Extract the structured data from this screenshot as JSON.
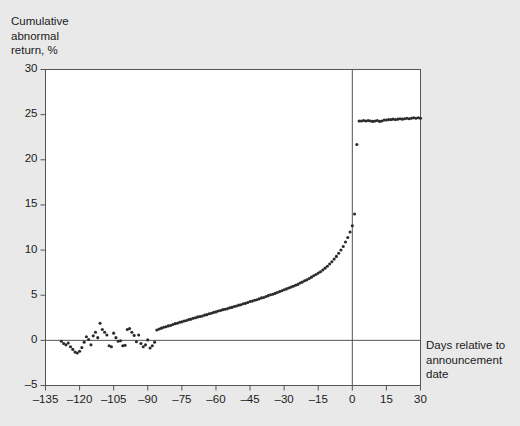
{
  "figure": {
    "background_color": "#e9e9e9",
    "plot_background_color": "#ffffff",
    "axis_color": "#555555",
    "marker_color": "#2b2b2b"
  },
  "chart_data": {
    "type": "scatter",
    "title": "",
    "ylabel": "Cumulative\nabnormal\nreturn, %",
    "xlabel": "Days relative to\nannouncement\ndate",
    "xlim": [
      -135,
      30
    ],
    "ylim": [
      -5,
      30
    ],
    "grid": false,
    "legend": null,
    "xticks": [
      -135,
      -120,
      -105,
      -90,
      -75,
      -60,
      -45,
      -30,
      -15,
      0,
      15,
      30
    ],
    "xtick_labels": [
      "–135",
      "–120",
      "–105",
      "–90",
      "–75",
      "–60",
      "–45",
      "–30",
      "–15",
      "0",
      "15",
      "30"
    ],
    "yticks": [
      -5,
      0,
      5,
      10,
      15,
      20,
      25,
      30
    ],
    "ytick_labels": [
      "–5",
      "0",
      "5",
      "10",
      "15",
      "20",
      "25",
      "30"
    ],
    "reference_lines": [
      {
        "name": "zero-return-line",
        "orientation": "horizontal",
        "value": 0
      },
      {
        "name": "announcement-day-line",
        "orientation": "vertical",
        "value": 0
      }
    ],
    "x": [
      -128,
      -127,
      -126,
      -125,
      -124,
      -123,
      -122,
      -121,
      -120,
      -119,
      -118,
      -117,
      -116,
      -115,
      -114,
      -113,
      -112,
      -111,
      -110,
      -109,
      -108,
      -107,
      -106,
      -105,
      -104,
      -103,
      -102,
      -101,
      -100,
      -99,
      -98,
      -97,
      -96,
      -95,
      -94,
      -93,
      -92,
      -91,
      -90,
      -89,
      -88,
      -87,
      -86,
      -85,
      -84,
      -83,
      -82,
      -81,
      -80,
      -79,
      -78,
      -77,
      -76,
      -75,
      -74,
      -73,
      -72,
      -71,
      -70,
      -69,
      -68,
      -67,
      -66,
      -65,
      -64,
      -63,
      -62,
      -61,
      -60,
      -59,
      -58,
      -57,
      -56,
      -55,
      -54,
      -53,
      -52,
      -51,
      -50,
      -49,
      -48,
      -47,
      -46,
      -45,
      -44,
      -43,
      -42,
      -41,
      -40,
      -39,
      -38,
      -37,
      -36,
      -35,
      -34,
      -33,
      -32,
      -31,
      -30,
      -29,
      -28,
      -27,
      -26,
      -25,
      -24,
      -23,
      -22,
      -21,
      -20,
      -19,
      -18,
      -17,
      -16,
      -15,
      -14,
      -13,
      -12,
      -11,
      -10,
      -9,
      -8,
      -7,
      -6,
      -5,
      -4,
      -3,
      -2,
      -1,
      0,
      1,
      2,
      3,
      4,
      5,
      6,
      7,
      8,
      9,
      10,
      11,
      12,
      13,
      14,
      15,
      16,
      17,
      18,
      19,
      20,
      21,
      22,
      23,
      24,
      25,
      26,
      27,
      28,
      29,
      30
    ],
    "y": [
      -0.1,
      -0.35,
      -0.5,
      -0.3,
      -0.7,
      -1.0,
      -1.3,
      -1.4,
      -1.2,
      -0.8,
      -0.2,
      0.4,
      0.1,
      -0.5,
      0.5,
      0.9,
      0.3,
      1.9,
      1.2,
      0.9,
      0.6,
      -0.6,
      -0.7,
      0.8,
      0.3,
      -0.1,
      -0.05,
      -0.6,
      -0.55,
      1.2,
      1.3,
      0.9,
      0.55,
      -0.15,
      0.6,
      -0.35,
      -0.7,
      -0.5,
      0.05,
      -0.85,
      -0.6,
      -0.2,
      1.15,
      1.25,
      1.35,
      1.45,
      1.5,
      1.6,
      1.65,
      1.75,
      1.85,
      1.9,
      2.0,
      2.05,
      2.15,
      2.2,
      2.3,
      2.35,
      2.45,
      2.5,
      2.6,
      2.65,
      2.7,
      2.8,
      2.85,
      2.95,
      3.0,
      3.1,
      3.15,
      3.25,
      3.3,
      3.4,
      3.45,
      3.5,
      3.6,
      3.65,
      3.75,
      3.8,
      3.9,
      3.95,
      4.05,
      4.1,
      4.2,
      4.3,
      4.35,
      4.45,
      4.5,
      4.6,
      4.7,
      4.75,
      4.85,
      4.95,
      5.05,
      5.1,
      5.2,
      5.3,
      5.4,
      5.5,
      5.6,
      5.7,
      5.8,
      5.9,
      6.0,
      6.1,
      6.2,
      6.35,
      6.45,
      6.6,
      6.7,
      6.85,
      7.0,
      7.15,
      7.3,
      7.45,
      7.6,
      7.8,
      8.0,
      8.2,
      8.45,
      8.7,
      9.0,
      9.3,
      9.65,
      10.0,
      10.4,
      10.9,
      11.4,
      12.0,
      12.7,
      14.0,
      21.7,
      24.3,
      24.3,
      24.35,
      24.3,
      24.35,
      24.3,
      24.25,
      24.3,
      24.35,
      24.25,
      24.3,
      24.4,
      24.4,
      24.45,
      24.45,
      24.5,
      24.45,
      24.5,
      24.55,
      24.5,
      24.55,
      24.6,
      24.55,
      24.6,
      24.65,
      24.6,
      24.65,
      24.6,
      24.7,
      24.65,
      24.7,
      24.7
    ]
  }
}
